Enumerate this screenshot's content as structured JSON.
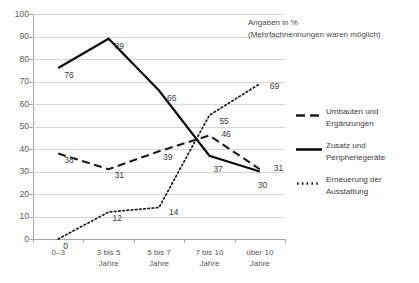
{
  "chart_data": {
    "type": "line",
    "title": "",
    "xlabel": "",
    "ylabel": "",
    "ylim": [
      0,
      100
    ],
    "ytick_step": 10,
    "grid": true,
    "legend_position": "right",
    "annotation_lines": [
      "Angaben in %",
      "(Mehrfachnennungen waren möglich)"
    ],
    "categories": [
      "0–3",
      "3 bis 5 Jahre",
      "5 bis 7 Jahre",
      "7 bis 10 Jahre",
      "über 10 Jahre"
    ],
    "category_lines": [
      [
        "0–3",
        ""
      ],
      [
        "3 bis 5",
        "Jahre"
      ],
      [
        "5 bis 7",
        "Jahre"
      ],
      [
        "7 bis 10",
        "Jahre"
      ],
      [
        "über 10",
        "Jahre"
      ]
    ],
    "ytick_labels": [
      "0",
      "10",
      "20",
      "30",
      "40",
      "50",
      "60",
      "70",
      "80",
      "90",
      "100"
    ],
    "series": [
      {
        "name": "Umbauten und Ergänzungen",
        "name_lines": [
          "Umbauten und",
          "Ergänzungen"
        ],
        "style": "dashed",
        "color": "#1a1a1a",
        "values": [
          38,
          31,
          39,
          46,
          31
        ],
        "labels": [
          "38",
          "31",
          "39",
          "46",
          "31"
        ]
      },
      {
        "name": "Zusatz und Peripheriegeräte",
        "name_lines": [
          "Zusatz und",
          "Peripheriegeräte"
        ],
        "style": "solid",
        "color": "#0d0d0d",
        "values": [
          76,
          89,
          66,
          37,
          30
        ],
        "labels": [
          "76",
          "89",
          "66",
          "37",
          "30"
        ]
      },
      {
        "name": "Erneuerung der Ausstattung",
        "name_lines": [
          "Erneuerung der",
          "Ausstattung"
        ],
        "style": "dotted",
        "color": "#1a1a1a",
        "values": [
          0,
          12,
          14,
          55,
          69
        ],
        "labels": [
          "0",
          "12",
          "14",
          "55",
          "69"
        ]
      }
    ]
  },
  "axis": {
    "y_ticks": [
      "100",
      "90",
      "80",
      "70",
      "60",
      "50",
      "40",
      "30",
      "20",
      "10",
      "0"
    ]
  },
  "annotation": {
    "line1": "Angaben in %",
    "line2": "(Mehrfachnennungen waren möglich)"
  },
  "legend": {
    "items": [
      {
        "marker": "dashed-line-icon",
        "line1": "Umbauten und",
        "line2": "Ergänzungen"
      },
      {
        "marker": "solid-line-icon",
        "line1": "Zusatz und",
        "line2": "Peripheriegeräte"
      },
      {
        "marker": "dotted-line-icon",
        "line1": "Erneuerung der",
        "line2": "Ausstattung"
      }
    ]
  },
  "xaxis": {
    "labels": [
      {
        "line1": "0–3",
        "line2": ""
      },
      {
        "line1": "3 bis 5",
        "line2": "Jahre"
      },
      {
        "line1": "5 bis 7",
        "line2": "Jahre"
      },
      {
        "line1": "7 bis 10",
        "line2": "Jahre"
      },
      {
        "line1": "über 10",
        "line2": "Jahre"
      }
    ]
  },
  "point_labels": {
    "dashed": [
      "38",
      "31",
      "39",
      "46",
      "31"
    ],
    "solid": [
      "76",
      "89",
      "66",
      "37",
      "30"
    ],
    "dotted": [
      "0",
      "12",
      "14",
      "55",
      "69"
    ]
  }
}
